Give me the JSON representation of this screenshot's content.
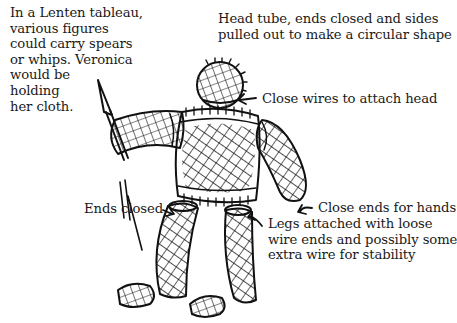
{
  "figure": {
    "ink_color": "#111111",
    "background": "#ffffff"
  },
  "annotations": {
    "intro": "In a Lenten tableau,\nvarious figures\ncould carry spears\nor whips. Veronica\nwould be\nholding\nher cloth.",
    "head_tube": "Head tube, ends closed and sides\npulled out to make a circular shape",
    "close_wires": "Close wires to attach head",
    "ends_closed": "Ends closed",
    "close_ends_hands": "Close ends for hands",
    "legs_attached": "Legs attached with loose\nwire ends and possibly some\nextra wire for stability"
  }
}
